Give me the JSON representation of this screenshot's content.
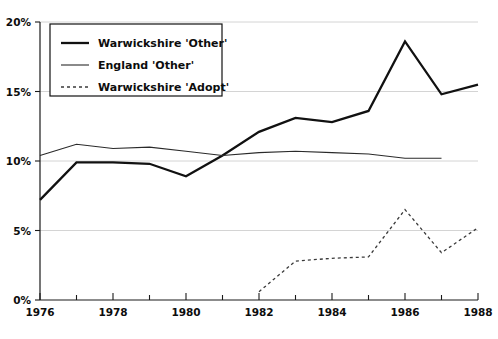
{
  "chart_data": {
    "type": "line",
    "title": "",
    "subtitle": "",
    "xlabel": "",
    "ylabel": "",
    "xlim": [
      1976,
      1988
    ],
    "ylim": [
      0,
      20
    ],
    "grid": true,
    "grid_axis": "y",
    "legend_position": "top-left-inside",
    "x": [
      1976,
      1977,
      1978,
      1979,
      1980,
      1981,
      1982,
      1983,
      1984,
      1985,
      1986,
      1987,
      1988
    ],
    "x_tick_labels": [
      "1976",
      "",
      "1978",
      "",
      "1980",
      "",
      "1982",
      "",
      "1984",
      "",
      "1986",
      "",
      "1988"
    ],
    "x_major_labels": [
      "1976",
      "1978",
      "1980",
      "1982",
      "1984",
      "1986",
      "1988"
    ],
    "y_ticks": [
      0,
      5,
      10,
      15,
      20
    ],
    "y_tick_labels": [
      "0%",
      "5%",
      "10%",
      "15%",
      "20%"
    ],
    "series": [
      {
        "name": "Warwickshire 'Other'",
        "style": "solid-thick",
        "color": "#111111",
        "x": [
          1976,
          1977,
          1978,
          1979,
          1980,
          1981,
          1982,
          1983,
          1984,
          1985,
          1986,
          1987,
          1988
        ],
        "values": [
          7.2,
          9.9,
          9.9,
          9.8,
          8.9,
          10.4,
          12.1,
          13.1,
          12.8,
          13.6,
          18.6,
          14.8,
          15.5
        ]
      },
      {
        "name": "England 'Other'",
        "style": "solid-thin",
        "color": "#2a2a2a",
        "x": [
          1976,
          1977,
          1978,
          1979,
          1980,
          1981,
          1982,
          1983,
          1984,
          1985,
          1986,
          1987
        ],
        "values": [
          10.4,
          11.2,
          10.9,
          11.0,
          10.7,
          10.4,
          10.6,
          10.7,
          10.6,
          10.5,
          10.2,
          10.2
        ]
      },
      {
        "name": "Warwickshire 'Adopt'",
        "style": "dashed",
        "color": "#3a3a3a",
        "x": [
          1982,
          1983,
          1984,
          1985,
          1986,
          1987,
          1988
        ],
        "values": [
          0.6,
          2.8,
          3.0,
          3.1,
          6.5,
          3.4,
          5.2
        ]
      }
    ],
    "legend_entries": [
      {
        "label": "Warwickshire 'Other'",
        "style": "solid-thick"
      },
      {
        "label": "England 'Other'",
        "style": "solid-thin"
      },
      {
        "label": "Warwickshire 'Adopt'",
        "style": "dashed"
      }
    ]
  }
}
